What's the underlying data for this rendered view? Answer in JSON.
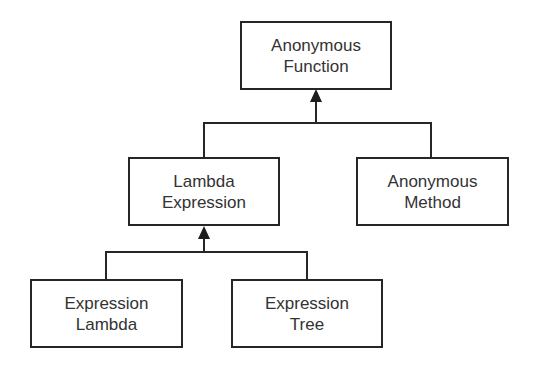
{
  "diagram": {
    "type": "hierarchy",
    "nodes": [
      {
        "id": "anonymous-function",
        "line1": "Anonymous",
        "line2": "Function"
      },
      {
        "id": "lambda-expression",
        "line1": "Lambda",
        "line2": "Expression"
      },
      {
        "id": "anonymous-method",
        "line1": "Anonymous",
        "line2": "Method"
      },
      {
        "id": "expression-lambda",
        "line1": "Expression",
        "line2": "Lambda"
      },
      {
        "id": "expression-tree",
        "line1": "Expression",
        "line2": "Tree"
      }
    ],
    "edges": [
      {
        "from": "lambda-expression",
        "to": "anonymous-function"
      },
      {
        "from": "anonymous-method",
        "to": "anonymous-function"
      },
      {
        "from": "expression-lambda",
        "to": "lambda-expression"
      },
      {
        "from": "expression-tree",
        "to": "lambda-expression"
      }
    ],
    "colors": {
      "stroke": "#262626",
      "text": "#333333",
      "background": "#ffffff"
    }
  }
}
